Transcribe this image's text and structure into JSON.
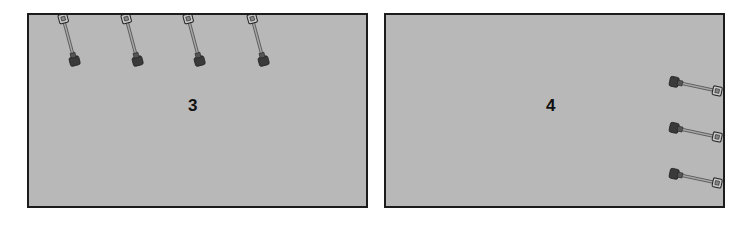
{
  "panels": [
    {
      "label": "3",
      "shovel_count": 4,
      "shovel_orientation": "vertical, blade down, handle up, slight tilt",
      "shovel_positions": "along top edge"
    },
    {
      "label": "4",
      "shovel_count": 3,
      "shovel_orientation": "horizontal, blade left, handle right, slight tilt",
      "shovel_positions": "along right edge"
    }
  ],
  "colors": {
    "panel_fill": "#b8b8b8",
    "panel_border": "#1c1c1c",
    "label": "#111111",
    "shovel_blade": "#3a3a3a",
    "shovel_shaft": "#8a8a8a"
  }
}
